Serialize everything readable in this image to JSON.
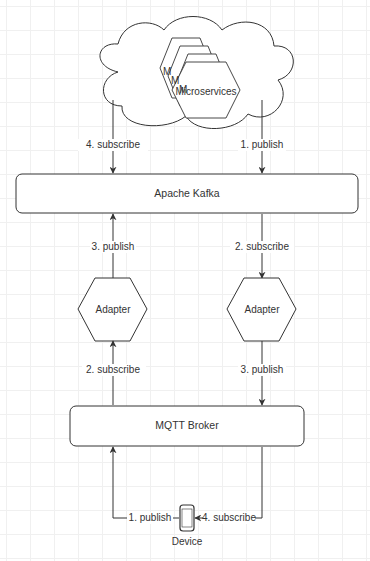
{
  "diagram": {
    "colors": {
      "stroke": "#333333",
      "text": "#333333",
      "grid": "#f0f0f0",
      "background": "#ffffff"
    },
    "cloud": {
      "microservices_label": "Microservices",
      "stacked_label_fragment": "M"
    },
    "kafka": {
      "label": "Apache Kafka"
    },
    "mqtt": {
      "label": "MQTT Broker"
    },
    "adapters": [
      {
        "label": "Adapter"
      },
      {
        "label": "Adapter"
      }
    ],
    "device": {
      "label": "Device"
    },
    "edges": {
      "microservices_to_kafka": "1. publish",
      "kafka_to_microservices": "4. subscribe",
      "left_adapter_to_kafka": "3. publish",
      "right_adapter_from_kafka": "2. subscribe",
      "left_adapter_from_mqtt": "2. subscribe",
      "right_adapter_to_mqtt": "3. publish",
      "device_to_mqtt": "1. publish",
      "mqtt_to_device": "4. subscribe"
    }
  }
}
